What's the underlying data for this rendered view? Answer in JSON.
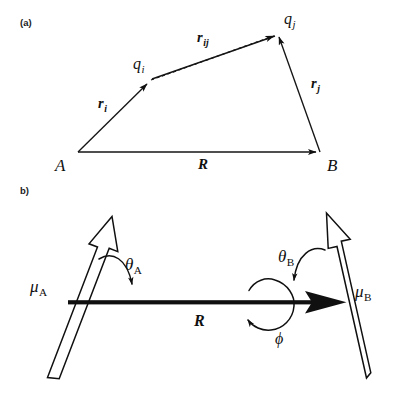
{
  "figure": {
    "title_present": false,
    "background_color": "#ffffff",
    "ink_color": "#101010",
    "panels": [
      {
        "id": "a",
        "label": "(a)",
        "description": "Vector geometry between two charge sites on molecules A and B",
        "vertices": [
          {
            "name": "A",
            "label": "A",
            "x": 78,
            "y": 152
          },
          {
            "name": "B",
            "label": "B",
            "x": 320,
            "y": 152
          },
          {
            "name": "qi",
            "label": "q",
            "subscript": "i",
            "x": 150,
            "y": 81
          },
          {
            "name": "qj",
            "label": "q",
            "subscript": "j",
            "x": 277,
            "y": 33
          }
        ],
        "vectors": [
          {
            "name": "r_i",
            "label": "r",
            "subscript": "i",
            "style": "solid",
            "from": "A",
            "to": "qi"
          },
          {
            "name": "r_j",
            "label": "r",
            "subscript": "j",
            "style": "solid",
            "from": "B",
            "to": "qj"
          },
          {
            "name": "r_ij",
            "label": "r",
            "subscript": "ij",
            "style": "dashed",
            "from": "qi",
            "to": "qj"
          },
          {
            "name": "R",
            "label": "R",
            "subscript": "",
            "style": "solid",
            "from": "A",
            "to": "B"
          }
        ],
        "label_positions": {
          "r_i": {
            "x": 98,
            "y": 108
          },
          "r_ij": {
            "x": 197,
            "y": 42
          },
          "r_j": {
            "x": 311,
            "y": 88
          },
          "R": {
            "x": 198,
            "y": 169
          },
          "q_i": {
            "x": 133,
            "y": 69
          },
          "q_j": {
            "x": 284,
            "y": 24
          },
          "A": {
            "x": 55,
            "y": 171
          },
          "B": {
            "x": 327,
            "y": 171
          }
        }
      },
      {
        "id": "b",
        "label": "b)",
        "description": "Two point dipoles mu_A and mu_B separated by vector R with orientation angles theta_A, theta_B and torsion angle phi",
        "labels": [
          {
            "name": "mu_A",
            "label": "μ",
            "subscript": "A",
            "x": 30,
            "y": 292
          },
          {
            "name": "mu_B",
            "label": "μ",
            "subscript": "B",
            "x": 355,
            "y": 297
          },
          {
            "name": "theta_A",
            "label": "θ",
            "subscript": "A",
            "x": 125,
            "y": 270
          },
          {
            "name": "theta_B",
            "label": "θ",
            "subscript": "B",
            "x": 278,
            "y": 262
          },
          {
            "name": "phi",
            "label": "ϕ",
            "subscript": "",
            "x": 275,
            "y": 344
          },
          {
            "name": "R",
            "label": "R",
            "subscript": "",
            "x": 194,
            "y": 326
          }
        ],
        "dipole_A": {
          "tail_x": 52,
          "tail_y": 376,
          "head_x": 113,
          "head_y": 218,
          "fill": "#ffffff",
          "outline": "#101010"
        },
        "dipole_B": {
          "tail_x": 362,
          "tail_y": 378,
          "head_x": 327,
          "head_y": 215,
          "fill": "#ffffff",
          "outline": "#101010"
        },
        "separation_vector": {
          "from_x": 68,
          "from_y": 303,
          "to_x": 345,
          "to_y": 303,
          "style": "solid-bold"
        },
        "rotation_arrow": {
          "center_x": 272,
          "center_y": 303,
          "radius": 22,
          "direction": "counterclockwise"
        }
      }
    ]
  }
}
